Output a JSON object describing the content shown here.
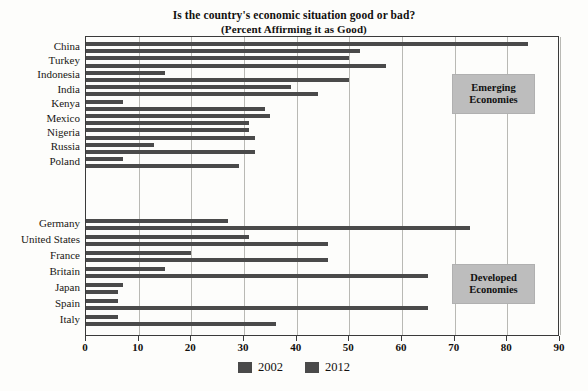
{
  "chart_data": {
    "type": "bar",
    "orientation": "horizontal",
    "title": "Is the country's economic situation good or bad?",
    "subtitle": "(Percent Affirming it as Good)",
    "xlabel": "",
    "ylabel": "",
    "xlim": [
      0,
      90
    ],
    "xticks": [
      0,
      10,
      20,
      30,
      40,
      50,
      60,
      70,
      80,
      90
    ],
    "grid": true,
    "legend_position": "bottom",
    "categories": [
      "China",
      "Turkey",
      "Indonesia",
      "India",
      "Kenya",
      "Mexico",
      "Nigeria",
      "Russia",
      "Poland",
      "Germany",
      "United States",
      "France",
      "Britain",
      "Japan",
      "Spain",
      "Italy"
    ],
    "series": [
      {
        "name": "2002",
        "color": "#4a4a4a",
        "values": [
          84,
          50,
          15,
          39,
          7,
          35,
          31,
          13,
          7,
          27,
          31,
          20,
          15,
          7,
          6,
          6
        ]
      },
      {
        "name": "2012",
        "color": "#4a4a4a",
        "values": [
          52,
          57,
          50,
          44,
          34,
          31,
          32,
          32,
          29,
          73,
          46,
          46,
          65,
          6,
          65,
          36
        ]
      }
    ],
    "groups": [
      {
        "label_line1": "Emerging",
        "label_line2": "Economies",
        "categories": [
          "China",
          "Turkey",
          "Indonesia",
          "India",
          "Kenya",
          "Mexico",
          "Nigeria",
          "Russia",
          "Poland"
        ]
      },
      {
        "label_line1": "Developed",
        "label_line2": "Economies",
        "categories": [
          "Germany",
          "United States",
          "France",
          "Britain",
          "Japan",
          "Spain",
          "Italy"
        ]
      }
    ]
  },
  "legend": {
    "items": [
      {
        "label": "2002"
      },
      {
        "label": "2012"
      }
    ]
  },
  "axis": {
    "tick_labels": [
      "0",
      "10",
      "20",
      "30",
      "40",
      "50",
      "60",
      "70",
      "80",
      "90"
    ]
  },
  "groups": {
    "emerging": {
      "line1": "Emerging",
      "line2": "Economies"
    },
    "developed": {
      "line1": "Developed",
      "line2": "Economies"
    }
  }
}
